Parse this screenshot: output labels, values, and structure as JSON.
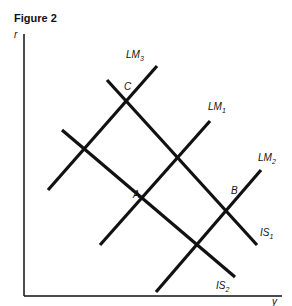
{
  "figure": {
    "title": "Figure 2",
    "axes": {
      "ylabel": "r",
      "xlabel": "y"
    },
    "curves": [
      {
        "name": "LM3",
        "label": "LM",
        "sub": "3",
        "x1": 48,
        "y1": 190,
        "x2": 157,
        "y2": 66,
        "lx": 126,
        "ly": 58
      },
      {
        "name": "LM1",
        "label": "LM",
        "sub": "1",
        "x1": 100,
        "y1": 245,
        "x2": 210,
        "y2": 121,
        "lx": 208,
        "ly": 110
      },
      {
        "name": "LM2",
        "label": "LM",
        "sub": "2",
        "x1": 156,
        "y1": 292,
        "x2": 261,
        "y2": 170,
        "lx": 258,
        "ly": 161
      },
      {
        "name": "IS1",
        "label": "IS",
        "sub": "1",
        "x1": 107,
        "y1": 80,
        "x2": 257,
        "y2": 245,
        "lx": 260,
        "ly": 236
      },
      {
        "name": "IS2",
        "label": "IS",
        "sub": "2",
        "x1": 62,
        "y1": 130,
        "x2": 235,
        "y2": 277,
        "lx": 216,
        "ly": 289
      }
    ],
    "points": [
      {
        "label": "C",
        "x": 124,
        "y": 90
      },
      {
        "label": "A",
        "x": 133,
        "y": 198
      },
      {
        "label": "B",
        "x": 231,
        "y": 194
      }
    ]
  }
}
